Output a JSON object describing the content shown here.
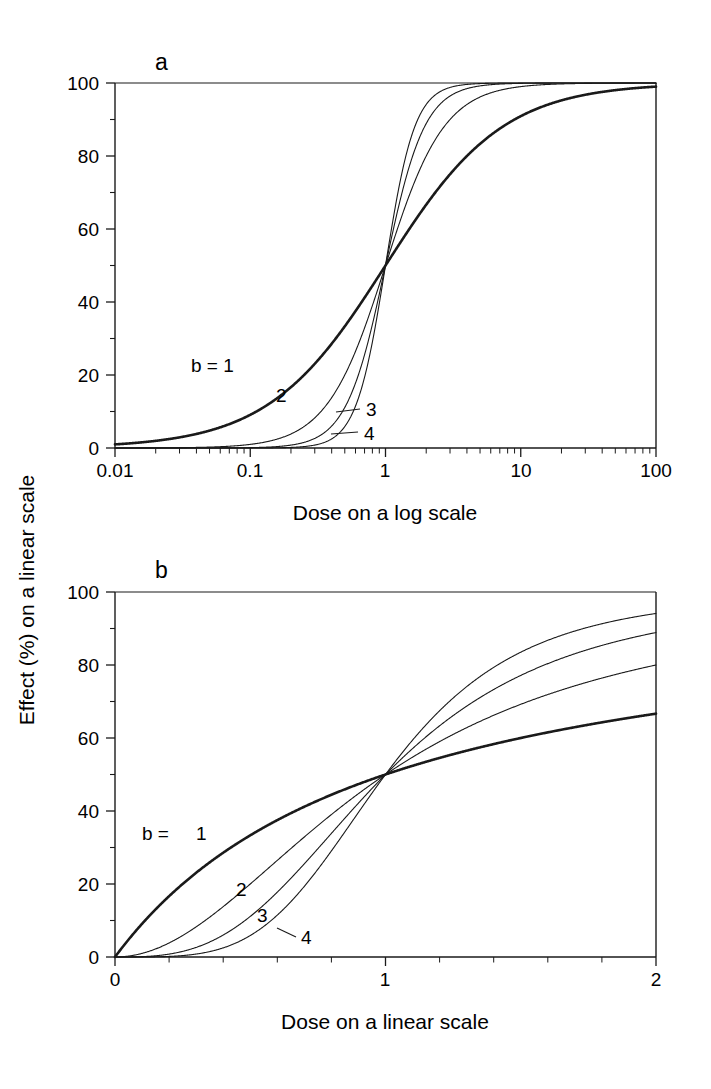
{
  "figure": {
    "background": "#ffffff",
    "line_color": "#1a1a1a",
    "shared_ylabel": "Effect (%) on a linear scale"
  },
  "panels": [
    {
      "key": "a",
      "label": "a",
      "xlabel": "Dose on a log scale",
      "xticklabels": [
        "0.01",
        "0.1",
        "1",
        "10",
        "100"
      ],
      "yticklabels": [
        "0",
        "20",
        "40",
        "60",
        "80",
        "100"
      ],
      "curve_labels": [
        {
          "text": "b = 1",
          "leader": false
        },
        {
          "text": "2",
          "leader": false
        },
        {
          "text": "3",
          "leader": true
        },
        {
          "text": "4",
          "leader": true
        }
      ]
    },
    {
      "key": "b",
      "label": "b",
      "xlabel": "Dose on a linear scale",
      "xticklabels": [
        "0",
        "1",
        "2"
      ],
      "yticklabels": [
        "0",
        "20",
        "40",
        "60",
        "80",
        "100"
      ],
      "curve_labels": [
        {
          "text": "b =",
          "leader": false
        },
        {
          "text": "1",
          "leader": false
        },
        {
          "text": "2",
          "leader": false
        },
        {
          "text": "3",
          "leader": false
        },
        {
          "text": "4",
          "leader": true
        }
      ]
    }
  ],
  "chart_data": [
    {
      "type": "line",
      "panel": "a",
      "title": "a",
      "xlabel": "Dose on a log scale",
      "ylabel": "Effect (%) on a linear scale",
      "xscale": "log",
      "yscale": "linear",
      "xlim": [
        0.01,
        100
      ],
      "ylim": [
        0,
        100
      ],
      "xticks": [
        0.01,
        0.1,
        1,
        10,
        100
      ],
      "yticks": [
        0,
        20,
        40,
        60,
        80,
        100
      ],
      "grid": false,
      "legend": "inline-curve-labels",
      "equation": "E = 100 * D^b / (D^b + 1)",
      "crossing_point": {
        "dose": 1,
        "effect": 50
      },
      "series": [
        {
          "name": "b = 1",
          "hill_slope": 1,
          "linewidth": "thick",
          "x": [
            0.01,
            0.02,
            0.05,
            0.1,
            0.2,
            0.3,
            0.5,
            0.7,
            1,
            1.5,
            2,
            3,
            5,
            10,
            20,
            50,
            100
          ],
          "values": [
            0.99,
            1.96,
            4.76,
            9.09,
            16.7,
            23.1,
            33.3,
            41.2,
            50,
            60,
            66.7,
            75,
            83.3,
            90.9,
            95.2,
            98,
            99
          ]
        },
        {
          "name": "2",
          "hill_slope": 2,
          "linewidth": "thin",
          "x": [
            0.01,
            0.02,
            0.05,
            0.1,
            0.2,
            0.3,
            0.5,
            0.7,
            1,
            1.5,
            2,
            3,
            5,
            10,
            20,
            50,
            100
          ],
          "values": [
            0.01,
            0.04,
            0.25,
            0.99,
            3.85,
            8.26,
            20.0,
            32.9,
            50,
            69.2,
            80.0,
            90.0,
            96.2,
            99.0,
            99.8,
            99.96,
            99.99
          ]
        },
        {
          "name": "3",
          "hill_slope": 3,
          "linewidth": "thin",
          "x": [
            0.01,
            0.02,
            0.05,
            0.1,
            0.2,
            0.3,
            0.5,
            0.7,
            1,
            1.5,
            2,
            3,
            5,
            10,
            20,
            50,
            100
          ],
          "values": [
            0.0,
            0.0,
            0.01,
            0.1,
            0.79,
            2.63,
            11.1,
            25.5,
            50,
            77.1,
            88.9,
            96.4,
            99.2,
            99.9,
            99.99,
            100,
            100
          ]
        },
        {
          "name": "4",
          "hill_slope": 4,
          "linewidth": "thin",
          "x": [
            0.01,
            0.02,
            0.05,
            0.1,
            0.2,
            0.3,
            0.5,
            0.7,
            1,
            1.5,
            2,
            3,
            5,
            10,
            20,
            50,
            100
          ],
          "values": [
            0.0,
            0.0,
            0.0,
            0.01,
            0.16,
            0.8,
            5.88,
            19.4,
            50,
            83.5,
            94.1,
            98.8,
            99.84,
            99.99,
            100,
            100,
            100
          ]
        }
      ]
    },
    {
      "type": "line",
      "panel": "b",
      "title": "b",
      "xlabel": "Dose on a linear scale",
      "ylabel": "Effect (%) on a linear scale",
      "xscale": "linear",
      "yscale": "linear",
      "xlim": [
        0,
        2
      ],
      "ylim": [
        0,
        100
      ],
      "xticks": [
        0,
        1,
        2
      ],
      "yticks": [
        0,
        20,
        40,
        60,
        80,
        100
      ],
      "grid": false,
      "legend": "inline-curve-labels",
      "equation": "E = 100 * D^b / (D^b + 1)",
      "crossing_point": {
        "dose": 1,
        "effect": 50
      },
      "series": [
        {
          "name": "1",
          "hill_slope": 1,
          "linewidth": "thick",
          "x": [
            0,
            0.2,
            0.4,
            0.6,
            0.8,
            1.0,
            1.2,
            1.4,
            1.6,
            1.8,
            2.0
          ],
          "values": [
            0,
            16.7,
            28.6,
            37.5,
            44.4,
            50,
            54.5,
            58.3,
            61.5,
            64.3,
            66.7
          ]
        },
        {
          "name": "2",
          "hill_slope": 2,
          "linewidth": "thin",
          "x": [
            0,
            0.2,
            0.4,
            0.6,
            0.8,
            1.0,
            1.2,
            1.4,
            1.6,
            1.8,
            2.0
          ],
          "values": [
            0,
            3.85,
            13.8,
            26.5,
            39.0,
            50,
            59.0,
            66.2,
            71.9,
            76.4,
            80.0
          ]
        },
        {
          "name": "3",
          "hill_slope": 3,
          "linewidth": "thin",
          "x": [
            0,
            0.2,
            0.4,
            0.6,
            0.8,
            1.0,
            1.2,
            1.4,
            1.6,
            1.8,
            2.0
          ],
          "values": [
            0,
            0.79,
            6.01,
            17.8,
            33.8,
            50,
            63.3,
            73.3,
            80.4,
            85.4,
            88.9
          ]
        },
        {
          "name": "4",
          "hill_slope": 4,
          "linewidth": "thin",
          "x": [
            0,
            0.2,
            0.4,
            0.6,
            0.8,
            1.0,
            1.2,
            1.4,
            1.6,
            1.8,
            2.0
          ],
          "values": [
            0,
            0.16,
            2.5,
            11.5,
            29.1,
            50,
            67.4,
            79.3,
            86.7,
            91.3,
            94.1
          ]
        }
      ]
    }
  ]
}
